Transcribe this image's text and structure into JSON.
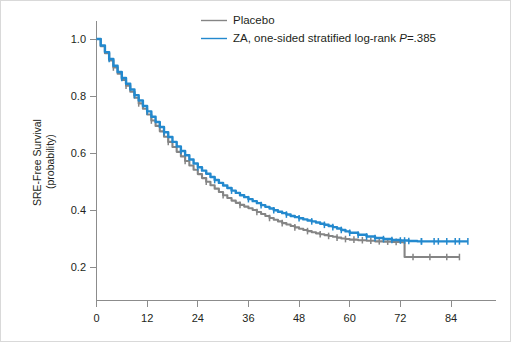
{
  "chart_data": {
    "type": "line",
    "title": "",
    "subtitle": "",
    "xlabel": "",
    "ylabel_line1": "SRE-Free Survival",
    "ylabel_line2": "(probability)",
    "xlim": [
      0,
      90
    ],
    "ylim": [
      0.1,
      1.05
    ],
    "grid": false,
    "legend_position": "top-center",
    "x_ticks": [
      0,
      12,
      24,
      36,
      48,
      60,
      72,
      84
    ],
    "x_tick_labels": [
      "0",
      "12",
      "24",
      "36",
      "48",
      "60",
      "72",
      "84"
    ],
    "y_ticks": [
      0.2,
      0.4,
      0.6,
      0.8,
      1.0
    ],
    "y_tick_labels": [
      "0.2",
      "0.4",
      "0.6",
      "0.8",
      "1.0"
    ],
    "series": [
      {
        "name": "Placebo",
        "color": "#858585",
        "legend_label": "Placebo",
        "x": [
          0,
          1,
          2,
          3,
          4,
          5,
          6,
          7,
          8,
          9,
          10,
          11,
          12,
          13,
          14,
          15,
          16,
          17,
          18,
          19,
          20,
          21,
          22,
          23,
          24,
          25,
          26,
          27,
          28,
          29,
          30,
          31,
          32,
          33,
          34,
          35,
          36,
          37,
          38,
          39,
          40,
          41,
          42,
          43,
          44,
          45,
          46,
          47,
          48,
          49,
          50,
          51,
          52,
          53,
          54,
          55,
          56,
          57,
          58,
          59,
          60,
          62,
          64,
          66,
          68,
          70,
          72,
          73,
          76,
          80,
          84,
          86
        ],
        "y": [
          1.0,
          0.975,
          0.95,
          0.925,
          0.9,
          0.878,
          0.856,
          0.836,
          0.815,
          0.794,
          0.774,
          0.755,
          0.735,
          0.714,
          0.695,
          0.676,
          0.657,
          0.639,
          0.621,
          0.604,
          0.588,
          0.572,
          0.556,
          0.541,
          0.526,
          0.512,
          0.499,
          0.487,
          0.475,
          0.463,
          0.452,
          0.442,
          0.433,
          0.425,
          0.418,
          0.412,
          0.406,
          0.4,
          0.393,
          0.386,
          0.379,
          0.372,
          0.366,
          0.36,
          0.354,
          0.349,
          0.344,
          0.339,
          0.334,
          0.33,
          0.326,
          0.322,
          0.318,
          0.315,
          0.312,
          0.309,
          0.306,
          0.303,
          0.3,
          0.298,
          0.296,
          0.294,
          0.292,
          0.29,
          0.289,
          0.288,
          0.287,
          0.235,
          0.235,
          0.235,
          0.235,
          0.235
        ],
        "censor_x": [
          4,
          7,
          10,
          13,
          17,
          21,
          26,
          30,
          34,
          38,
          41,
          44,
          47,
          50,
          53,
          55,
          57,
          59,
          61,
          63,
          65,
          67,
          69,
          71,
          75,
          79,
          83,
          86
        ]
      },
      {
        "name": "ZA",
        "color": "#2389CE",
        "legend_label": "ZA, one-sided stratified log-rank ",
        "legend_label_italic": "P",
        "legend_label_tail": "=.385",
        "x": [
          0,
          1,
          2,
          3,
          4,
          5,
          6,
          7,
          8,
          9,
          10,
          11,
          12,
          13,
          14,
          15,
          16,
          17,
          18,
          19,
          20,
          21,
          22,
          23,
          24,
          25,
          26,
          27,
          28,
          29,
          30,
          31,
          32,
          33,
          34,
          35,
          36,
          37,
          38,
          39,
          40,
          41,
          42,
          43,
          44,
          45,
          46,
          47,
          48,
          49,
          50,
          51,
          52,
          53,
          54,
          55,
          56,
          57,
          58,
          59,
          60,
          62,
          64,
          66,
          68,
          70,
          72,
          74,
          76,
          78,
          80,
          82,
          84,
          86,
          88
        ],
        "y": [
          1.0,
          0.977,
          0.954,
          0.93,
          0.906,
          0.884,
          0.863,
          0.843,
          0.823,
          0.803,
          0.784,
          0.765,
          0.746,
          0.727,
          0.709,
          0.691,
          0.673,
          0.656,
          0.639,
          0.623,
          0.607,
          0.592,
          0.577,
          0.563,
          0.55,
          0.538,
          0.527,
          0.516,
          0.505,
          0.495,
          0.486,
          0.477,
          0.468,
          0.46,
          0.452,
          0.445,
          0.438,
          0.431,
          0.424,
          0.417,
          0.411,
          0.405,
          0.399,
          0.394,
          0.389,
          0.384,
          0.379,
          0.375,
          0.371,
          0.367,
          0.363,
          0.36,
          0.356,
          0.352,
          0.348,
          0.344,
          0.34,
          0.335,
          0.33,
          0.325,
          0.32,
          0.313,
          0.307,
          0.302,
          0.298,
          0.295,
          0.293,
          0.291,
          0.29,
          0.29,
          0.29,
          0.29,
          0.29,
          0.29,
          0.29
        ],
        "censor_x": [
          3,
          6,
          9,
          12,
          16,
          20,
          24,
          28,
          32,
          36,
          39,
          42,
          45,
          48,
          51,
          54,
          56,
          58,
          60,
          62,
          64,
          66,
          68,
          70,
          72,
          74,
          77,
          80,
          83,
          86
        ],
        "censor_x_tail": [
          73,
          77,
          81,
          85,
          88
        ]
      }
    ]
  },
  "legend": {
    "items": [
      {
        "label": "Placebo",
        "color": "#858585"
      },
      {
        "label_pre": "ZA, one-sided stratified log-rank ",
        "label_italic": "P",
        "label_post": "=.385",
        "color": "#2389CE"
      }
    ]
  },
  "axes": {
    "y_title_line1": "SRE-Free Survival",
    "y_title_line2": "(probability)"
  },
  "colors": {
    "placebo": "#858585",
    "za": "#2389CE",
    "axis": "#8c8c8c",
    "text": "#231f20",
    "frame": "#d9d9d9",
    "background": "#ffffff"
  }
}
